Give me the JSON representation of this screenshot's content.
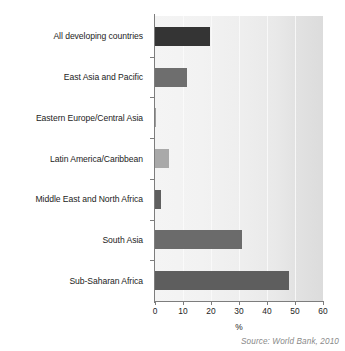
{
  "chart_data": {
    "type": "bar",
    "orientation": "horizontal",
    "title": "",
    "xlabel": "%",
    "ylabel": "",
    "xlim": [
      0,
      60
    ],
    "xticks": [
      0,
      10,
      20,
      30,
      40,
      50,
      60
    ],
    "grid": true,
    "legend": "none",
    "categories": [
      "All developing countries",
      "East Asia and Pacific",
      "Eastern Europe/Central Asia",
      "Latin America/Caribbean",
      "Middle East and North Africa",
      "South Asia",
      "Sub-Saharan Africa"
    ],
    "values": [
      19.5,
      11.5,
      0.3,
      5,
      2,
      31,
      48
    ],
    "bar_colors": [
      "#343434",
      "#6e6e6e",
      "#9c9c9c",
      "#a9a9a9",
      "#5f5f5f",
      "#6b6b6b",
      "#5e5e5e"
    ]
  },
  "source": {
    "note": "Source: World Bank, 2010"
  },
  "colors": {
    "plot_background": "#eeeeee",
    "axis": "#7d7d7d",
    "gridline": "#fafafa",
    "text": "#1c1c1c",
    "source_text": "#8a8a8a"
  }
}
